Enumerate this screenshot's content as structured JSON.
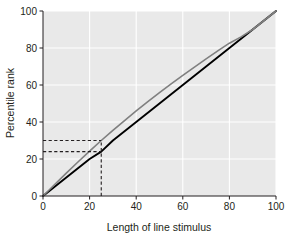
{
  "chart_data": {
    "type": "line",
    "title": "",
    "subtitle": "",
    "xlabel": "Length of line stimulus",
    "ylabel": "Percentile rank",
    "xlim": [
      0,
      100
    ],
    "ylim": [
      0,
      100
    ],
    "xticks": [
      0,
      20,
      40,
      60,
      80,
      100
    ],
    "yticks": [
      0,
      20,
      40,
      60,
      80,
      100
    ],
    "xtick_labels": [
      "0",
      "20",
      "40",
      "60",
      "80",
      "100"
    ],
    "ytick_labels": [
      "0",
      "20",
      "40",
      "60",
      "80",
      "100"
    ],
    "grid": true,
    "grid_color": "#ffffff",
    "plot_background": "#e9e9e9",
    "figure_background": "#ffffff",
    "legend": null,
    "legend_position": "none",
    "series": [
      {
        "name": "Identity line",
        "color": "#000000",
        "linewidth": 1.9,
        "style": "solid",
        "x": [
          0,
          10,
          20,
          25,
          30,
          40,
          50,
          60,
          70,
          80,
          90,
          100
        ],
        "values": [
          0,
          10,
          20,
          24,
          30,
          40,
          50,
          60,
          70,
          80,
          90,
          100
        ]
      },
      {
        "name": "Observed percentile curve",
        "color": "#808080",
        "linewidth": 1.6,
        "style": "solid",
        "x": [
          0,
          5,
          10,
          15,
          20,
          25,
          30,
          35,
          40,
          45,
          50,
          55,
          60,
          65,
          70,
          75,
          80,
          85,
          90,
          95,
          100
        ],
        "values": [
          0,
          6.2,
          12.4,
          18.4,
          24.3,
          30.0,
          35.5,
          40.8,
          46.0,
          51.0,
          55.9,
          60.6,
          65.2,
          69.7,
          74.1,
          78.4,
          82.6,
          86.0,
          90.0,
          95.0,
          100
        ]
      }
    ],
    "annotations": [
      {
        "name": "reference-x",
        "type": "dashed-vertical",
        "x": 25,
        "y_from": 0,
        "y_to": 30,
        "color": "#231f20"
      },
      {
        "name": "reference-y-gray",
        "type": "dashed-horizontal",
        "y": 30,
        "x_from": 0,
        "x_to": 25,
        "color": "#231f20"
      },
      {
        "name": "reference-y-black",
        "type": "dashed-horizontal",
        "y": 24,
        "x_from": 0,
        "x_to": 25,
        "color": "#231f20"
      }
    ]
  },
  "geometry": {
    "plot_left": 43,
    "plot_right": 276,
    "plot_top": 11,
    "plot_bottom": 196
  }
}
